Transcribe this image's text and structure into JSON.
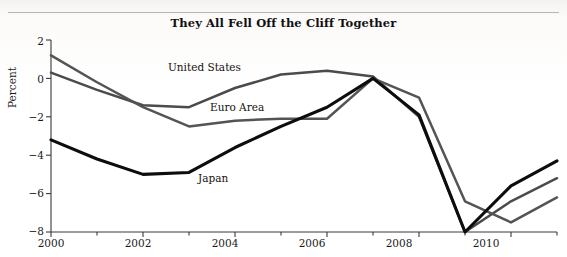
{
  "figure": {
    "title": "They All Fell Off the Cliff Together",
    "y_axis_title": "Percent"
  },
  "labels": {
    "united_states": "United States",
    "euro_area": "Euro Area",
    "japan": "Japan"
  },
  "axis": {
    "y_ticks": [
      "2",
      "0",
      "−2",
      "−4",
      "−6",
      "−8"
    ],
    "x_ticks": [
      "2000",
      "2002",
      "2004",
      "2006",
      "2008",
      "2010"
    ]
  },
  "colors": {
    "united_states": "#4b4b4b",
    "euro_area": "#545454",
    "japan": "#0d0d0d",
    "axis": "#3a3a3a",
    "background": "#ffffff"
  },
  "chart_data": {
    "type": "line",
    "title": "They All Fell Off the Cliff Together",
    "xlabel": "",
    "ylabel": "Percent",
    "xlim": [
      2000,
      2011
    ],
    "ylim": [
      -8,
      2
    ],
    "grid": false,
    "legend": "inline-annotations",
    "x": [
      2000,
      2001,
      2002,
      2003,
      2004,
      2005,
      2006,
      2007,
      2008,
      2009,
      2010,
      2011
    ],
    "series": [
      {
        "name": "United States",
        "color": "#4b4b4b",
        "values": [
          0.3,
          -0.6,
          -1.4,
          -1.5,
          -0.5,
          0.2,
          0.4,
          0.1,
          -2.0,
          -8.0,
          -6.4,
          -5.2
        ]
      },
      {
        "name": "Euro Area",
        "color": "#545454",
        "values": [
          1.2,
          -0.2,
          -1.5,
          -2.5,
          -2.2,
          -2.1,
          -2.1,
          0.0,
          -1.0,
          -6.4,
          -7.5,
          -6.2
        ]
      },
      {
        "name": "Japan",
        "color": "#0d0d0d",
        "values": [
          -3.2,
          -4.2,
          -5.0,
          -4.9,
          -3.6,
          -2.5,
          -1.5,
          0.0,
          -1.9,
          -8.0,
          -5.6,
          -4.3
        ]
      }
    ],
    "annotations": [
      {
        "text": "United States",
        "x": 2003.0,
        "y": 0.9
      },
      {
        "text": "Euro Area",
        "x": 2003.9,
        "y": -1.0
      },
      {
        "text": "Japan",
        "x": 2003.3,
        "y": -5.4
      }
    ]
  }
}
